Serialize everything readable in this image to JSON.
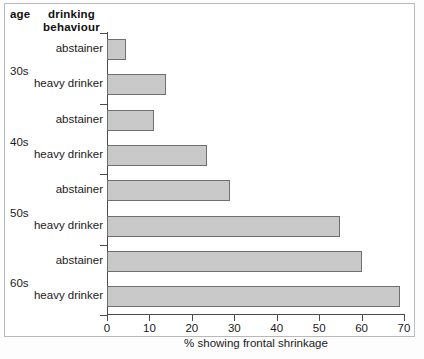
{
  "headers": {
    "age": "age",
    "behaviour_line1": "drinking",
    "behaviour_line2": "behaviour"
  },
  "axis": {
    "xlabel": "% showing frontal shrinkage",
    "ticks": [
      "0",
      "10",
      "20",
      "30",
      "40",
      "50",
      "60",
      "70"
    ]
  },
  "colors": {
    "bar_fill": "#c9c9c9",
    "bar_border": "#6f6f6f",
    "axis": "#4a4a4a",
    "text": "#1a1a1a",
    "background": "#ffffff"
  },
  "age_groups": [
    "30s",
    "40s",
    "50s",
    "60s"
  ],
  "bar_labels": [
    "abstainer",
    "heavy drinker",
    "abstainer",
    "heavy drinker",
    "abstainer",
    "heavy drinker",
    "abstainer",
    "heavy drinker"
  ],
  "chart_data": {
    "type": "bar",
    "orientation": "horizontal",
    "title": "",
    "xlabel": "% showing frontal shrinkage",
    "ylabel": "",
    "xlim": [
      0,
      70
    ],
    "xticks": [
      0,
      10,
      20,
      30,
      40,
      50,
      60,
      70
    ],
    "grid": false,
    "legend": "none",
    "group_header_age": "age",
    "group_header_behaviour": "drinking behaviour",
    "categories": [
      "30s abstainer",
      "30s heavy drinker",
      "40s abstainer",
      "40s heavy drinker",
      "50s abstainer",
      "50s heavy drinker",
      "60s abstainer",
      "60s heavy drinker"
    ],
    "values": [
      4.5,
      14,
      11,
      23.5,
      29,
      55,
      60,
      69
    ],
    "groups": [
      {
        "age": "30s",
        "abstainer": 4.5,
        "heavy_drinker": 14
      },
      {
        "age": "40s",
        "abstainer": 11,
        "heavy_drinker": 23.5
      },
      {
        "age": "50s",
        "abstainer": 29,
        "heavy_drinker": 55
      },
      {
        "age": "60s",
        "abstainer": 60,
        "heavy_drinker": 69
      }
    ]
  }
}
